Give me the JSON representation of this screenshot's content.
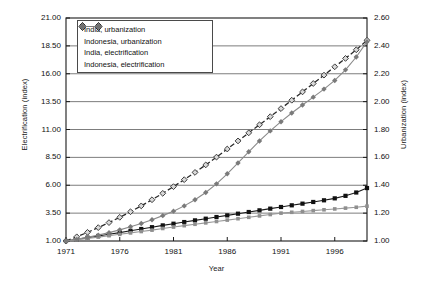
{
  "chart_data": {
    "type": "line",
    "title": "",
    "xlabel": "Year",
    "ylabel": "Electrification (index)",
    "y2label": "Urbanization (index)",
    "grid": true,
    "legend_position": "top-left-inside",
    "x": [
      1971,
      1972,
      1973,
      1974,
      1975,
      1976,
      1977,
      1978,
      1979,
      1980,
      1981,
      1982,
      1983,
      1984,
      1985,
      1986,
      1987,
      1988,
      1989,
      1990,
      1991,
      1992,
      1993,
      1994,
      1995,
      1996,
      1997,
      1998,
      1999
    ],
    "xlim": [
      1971,
      1999
    ],
    "xticks": [
      "1971",
      "1976",
      "1981",
      "1986",
      "1991",
      "1996"
    ],
    "xtick_values": [
      1971,
      1976,
      1981,
      1986,
      1991,
      1996
    ],
    "ylim": [
      1.0,
      21.0
    ],
    "yticks": [
      "1.00",
      "3.50",
      "6.00",
      "8.50",
      "11.00",
      "13.50",
      "16.00",
      "18.50",
      "21.00"
    ],
    "ytick_values": [
      1.0,
      3.5,
      6.0,
      8.5,
      11.0,
      13.5,
      16.0,
      18.5,
      21.0
    ],
    "y2lim": [
      1.0,
      2.6
    ],
    "y2ticks": [
      "1.00",
      "1.20",
      "1.40",
      "1.60",
      "1.80",
      "2.00",
      "2.20",
      "2.40",
      "2.60"
    ],
    "y2tick_values": [
      1.0,
      1.2,
      1.4,
      1.6,
      1.8,
      2.0,
      2.2,
      2.4,
      2.6
    ],
    "series": [
      {
        "name": "India, urbanization",
        "axis": "right",
        "color": "#1a1a1a",
        "marker": "filled-square",
        "linestyle": "solid",
        "values": [
          1.0,
          1.012,
          1.024,
          1.036,
          1.048,
          1.06,
          1.073,
          1.086,
          1.099,
          1.112,
          1.124,
          1.136,
          1.148,
          1.16,
          1.172,
          1.184,
          1.196,
          1.208,
          1.22,
          1.232,
          1.244,
          1.256,
          1.268,
          1.28,
          1.292,
          1.306,
          1.324,
          1.348,
          1.38
        ]
      },
      {
        "name": "Indonesia, urbanization",
        "axis": "right",
        "color": "#2b2b2b",
        "marker": "open-diamond",
        "linestyle": "dashed",
        "values": [
          1.0,
          1.03,
          1.062,
          1.096,
          1.132,
          1.17,
          1.21,
          1.252,
          1.296,
          1.342,
          1.39,
          1.44,
          1.492,
          1.546,
          1.602,
          1.66,
          1.718,
          1.776,
          1.834,
          1.892,
          1.95,
          2.01,
          2.07,
          2.13,
          2.19,
          2.25,
          2.31,
          2.372,
          2.44
        ]
      },
      {
        "name": "India, electrification",
        "axis": "right",
        "color": "#9a9a9a",
        "marker": "small-square",
        "linestyle": "solid",
        "values": [
          1.0,
          1.008,
          1.018,
          1.028,
          1.038,
          1.048,
          1.058,
          1.068,
          1.078,
          1.09,
          1.1,
          1.11,
          1.12,
          1.13,
          1.14,
          1.15,
          1.16,
          1.17,
          1.18,
          1.19,
          1.2,
          1.206,
          1.212,
          1.218,
          1.224,
          1.23,
          1.236,
          1.242,
          1.25
        ]
      },
      {
        "name": "Indonesia, electrification",
        "axis": "right",
        "color": "#8a8a8a",
        "marker": "gray-diamond",
        "linestyle": "solid",
        "values": [
          1.0,
          1.012,
          1.026,
          1.042,
          1.06,
          1.08,
          1.102,
          1.126,
          1.152,
          1.182,
          1.214,
          1.252,
          1.296,
          1.348,
          1.41,
          1.482,
          1.56,
          1.64,
          1.718,
          1.79,
          1.856,
          1.918,
          1.976,
          2.032,
          2.09,
          2.152,
          2.228,
          2.32,
          2.43
        ]
      }
    ]
  },
  "legend": {
    "items": [
      {
        "label": "India, urbanization"
      },
      {
        "label": "Indonesia, urbanization"
      },
      {
        "label": "India, electrification"
      },
      {
        "label": "Indonesia, electrification"
      }
    ]
  },
  "axes": {
    "left_title": "Electrification (index)",
    "right_title": "Urbanization (index)",
    "x_title": "Year"
  }
}
